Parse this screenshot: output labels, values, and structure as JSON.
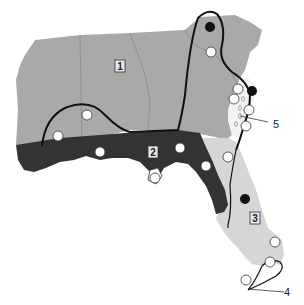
{
  "map": {
    "title": "",
    "colors": {
      "region1": "#a9a9a9",
      "region2": "#333333",
      "region3": "#d6d6d6",
      "coast_strip": "#f2f2f2",
      "boundary_line": "#111111",
      "state_border": "#8a8a8a",
      "open_site": "#ffffff",
      "filled_site": "#111111"
    },
    "regions": [
      {
        "id": "1",
        "label": "1"
      },
      {
        "id": "2",
        "label": "2"
      },
      {
        "id": "3",
        "label": "3"
      }
    ],
    "callouts": [
      {
        "id": "4",
        "label": "4"
      },
      {
        "id": "5",
        "label": "5"
      }
    ],
    "sites": {
      "open_count": 14,
      "filled_count": 3
    }
  }
}
